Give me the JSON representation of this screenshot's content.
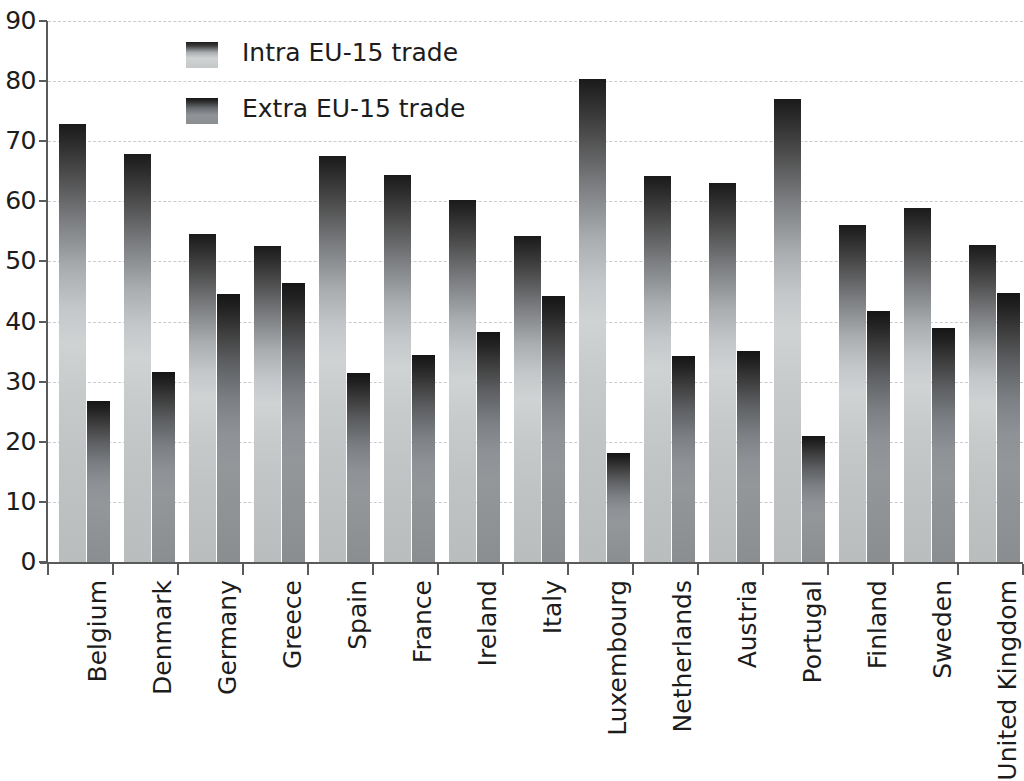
{
  "chart_data": {
    "type": "bar",
    "title": "",
    "subtitle": "",
    "xlabel": "",
    "ylabel": "",
    "ylim": [
      0,
      90
    ],
    "yticks": [
      0,
      10,
      20,
      30,
      40,
      50,
      60,
      70,
      80,
      90
    ],
    "ytick_labels": [
      "0",
      "10",
      "20",
      "30",
      "40",
      "50",
      "60",
      "70",
      "80",
      "90"
    ],
    "grid": true,
    "grid_style": "dashed horizontal",
    "legend_position": "top-left inside",
    "categories": [
      "Belgium",
      "Denmark",
      "Germany",
      "Greece",
      "Spain",
      "France",
      "Ireland",
      "Italy",
      "Luxembourg",
      "Netherlands",
      "Austria",
      "Portugal",
      "Finland",
      "Sweden",
      "United Kingdom"
    ],
    "series": [
      {
        "name": "Intra EU-15 trade",
        "color": "#c8ccce",
        "values": [
          72.8,
          67.8,
          54.6,
          52.5,
          67.6,
          64.3,
          60.3,
          54.3,
          80.4,
          64.2,
          63.0,
          77.0,
          56.0,
          58.9,
          52.7
        ]
      },
      {
        "name": "Extra EU-15 trade",
        "color": "#8e9296",
        "values": [
          26.8,
          31.6,
          44.6,
          46.4,
          31.4,
          34.5,
          38.3,
          44.2,
          18.1,
          34.2,
          35.1,
          21.0,
          41.8,
          38.9,
          44.8
        ]
      }
    ]
  },
  "legend": {
    "entries": [
      {
        "label": "Intra EU-15 trade",
        "swatch": "intra"
      },
      {
        "label": "Extra EU-15 trade",
        "swatch": "extra"
      }
    ]
  },
  "axes": {
    "y_tick_labels": [
      "90",
      "80",
      "70",
      "60",
      "50",
      "40",
      "30",
      "20",
      "10",
      "0"
    ]
  },
  "colors": {
    "axis": "#5a5a5a",
    "gridline": "#c9c9cf",
    "text": "#1c1c1c",
    "background": "#ffffff",
    "intra_bar": "#c8ccce",
    "extra_bar": "#8e9296"
  }
}
